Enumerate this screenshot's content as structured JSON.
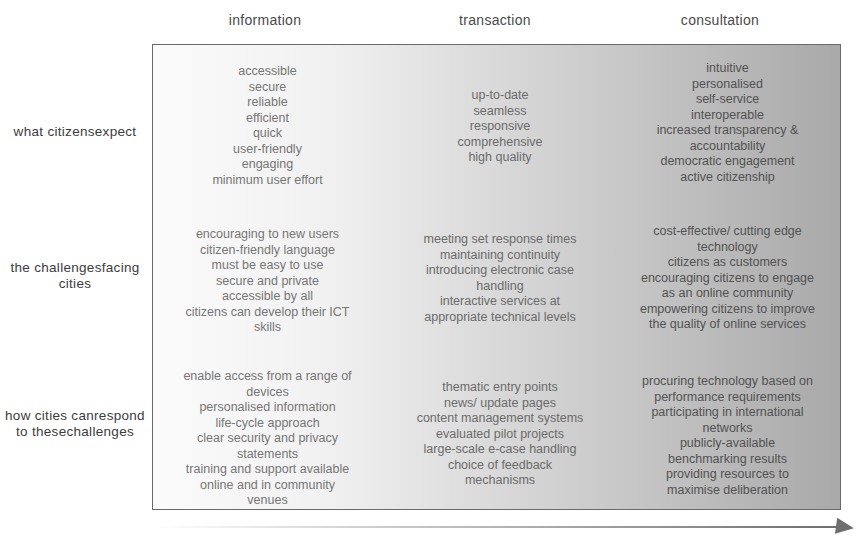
{
  "columns": [
    {
      "label": "information"
    },
    {
      "label": "transaction"
    },
    {
      "label": "consultation"
    }
  ],
  "rows": [
    {
      "label_lines": [
        "what citizens",
        "expect"
      ],
      "cells": [
        [
          "accessible",
          "secure",
          "reliable",
          "efficient",
          "quick",
          "user-friendly",
          "engaging",
          "minimum user effort"
        ],
        [
          "up-to-date",
          "seamless",
          "responsive",
          "comprehensive",
          "high quality"
        ],
        [
          "intuitive",
          "personalised",
          "self-service",
          "interoperable",
          "increased transparency &",
          "accountability",
          "democratic engagement",
          "active citizenship"
        ]
      ]
    },
    {
      "label_lines": [
        "the challenges",
        "facing cities"
      ],
      "cells": [
        [
          "encouraging to new users",
          "citizen-friendly language",
          "must be easy to use",
          "secure and private",
          "accessible by all",
          "citizens can develop their ICT",
          "skills"
        ],
        [
          "meeting set response times",
          "maintaining continuity",
          "introducing electronic case",
          "handling",
          "interactive services at",
          "appropriate technical levels"
        ],
        [
          "cost-effective/ cutting edge",
          "technology",
          "citizens as customers",
          "encouraging citizens to engage",
          "as an online community",
          "empowering citizens to improve",
          "the quality of online services"
        ]
      ]
    },
    {
      "label_lines": [
        "how cities can",
        "respond to these",
        "challenges"
      ],
      "cells": [
        [
          "enable access from a range of",
          "devices",
          "personalised information",
          "life-cycle approach",
          "clear security and privacy",
          "statements",
          "training and support available",
          "online and in community",
          "venues"
        ],
        [
          "thematic entry points",
          "news/ update pages",
          "content management systems",
          "evaluated pilot projects",
          "large-scale e-case handling",
          "choice of feedback",
          "mechanisms"
        ],
        [
          "procuring technology based on",
          "performance requirements",
          "participating in international",
          "networks",
          "publicly-available",
          "benchmarking results",
          "providing resources to",
          "maximise deliberation"
        ]
      ]
    }
  ],
  "colors": {
    "border": "#6a6a6a",
    "gradient_start": "#fbfbfb",
    "gradient_end": "#a9a9a9",
    "label_text": "#3c3c3c",
    "arrow": "#6e6e6e"
  }
}
